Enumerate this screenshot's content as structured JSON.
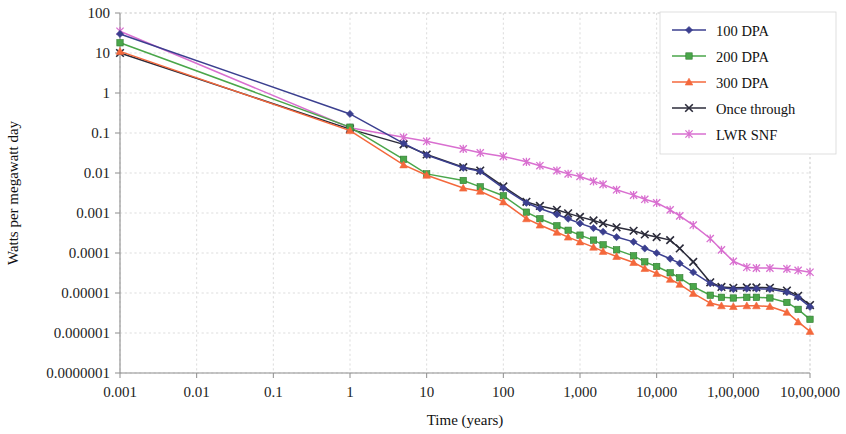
{
  "chart_data": {
    "type": "line",
    "title": "",
    "xlabel": "Time (years)",
    "ylabel": "Watts per megawatt day",
    "xscale": "log",
    "yscale": "log",
    "xlim": [
      0.001,
      1000000
    ],
    "ylim": [
      1e-07,
      100
    ],
    "grid": true,
    "legend_position": "top-right",
    "x_tick_labels": [
      "0.001",
      "0.01",
      "0.1",
      "1",
      "10",
      "100",
      "1,000",
      "10,000",
      "1,00,000",
      "10,00,000"
    ],
    "x_tick_values": [
      0.001,
      0.01,
      0.1,
      1,
      10,
      100,
      1000,
      10000,
      100000,
      1000000
    ],
    "y_tick_labels": [
      "100",
      "10",
      "1",
      "0.1",
      "0.01",
      "0.001",
      "0.0001",
      "0.00001",
      "0.000001",
      "0.0000001"
    ],
    "y_tick_values": [
      100,
      10,
      1,
      0.1,
      0.01,
      0.001,
      0.0001,
      1e-05,
      1e-06,
      1e-07
    ],
    "series": [
      {
        "name": "100 DPA",
        "color": "#3b3f8f",
        "marker": "diamond",
        "points": [
          [
            0.001,
            30
          ],
          [
            1,
            0.3
          ],
          [
            5,
            0.055
          ],
          [
            10,
            0.028
          ],
          [
            30,
            0.0135
          ],
          [
            50,
            0.011
          ],
          [
            100,
            0.0042
          ],
          [
            200,
            0.0018
          ],
          [
            300,
            0.0013
          ],
          [
            500,
            0.00092
          ],
          [
            700,
            0.00072
          ],
          [
            1000,
            0.00055
          ],
          [
            1500,
            0.00042
          ],
          [
            2000,
            0.00034
          ],
          [
            3000,
            0.00025
          ],
          [
            5000,
            0.00019
          ],
          [
            7000,
            0.00013
          ],
          [
            10000,
            0.0001
          ],
          [
            15000,
            7.2e-05
          ],
          [
            20000,
            5.5e-05
          ],
          [
            30000,
            3.3e-05
          ],
          [
            50000,
            1.75e-05
          ],
          [
            70000,
            1.35e-05
          ],
          [
            100000,
            1.25e-05
          ],
          [
            150000,
            1.28e-05
          ],
          [
            200000,
            1.28e-05
          ],
          [
            300000,
            1.25e-05
          ],
          [
            500000,
            1.05e-05
          ],
          [
            700000,
            7.8e-06
          ],
          [
            1000000,
            4.5e-06
          ]
        ]
      },
      {
        "name": "200 DPA",
        "color": "#4aa64a",
        "marker": "square",
        "points": [
          [
            0.001,
            18
          ],
          [
            1,
            0.14
          ],
          [
            5,
            0.022
          ],
          [
            10,
            0.0095
          ],
          [
            30,
            0.0065
          ],
          [
            50,
            0.0045
          ],
          [
            100,
            0.0027
          ],
          [
            200,
            0.00105
          ],
          [
            300,
            0.00072
          ],
          [
            500,
            0.00048
          ],
          [
            700,
            0.00037
          ],
          [
            1000,
            0.00028
          ],
          [
            1500,
            0.00021
          ],
          [
            2000,
            0.00016
          ],
          [
            3000,
            0.00012
          ],
          [
            5000,
            8.5e-05
          ],
          [
            7000,
            6e-05
          ],
          [
            10000,
            4.6e-05
          ],
          [
            15000,
            3.2e-05
          ],
          [
            20000,
            2.4e-05
          ],
          [
            30000,
            1.45e-05
          ],
          [
            50000,
            8.8e-06
          ],
          [
            70000,
            7.8e-06
          ],
          [
            100000,
            7.5e-06
          ],
          [
            150000,
            7.8e-06
          ],
          [
            200000,
            7.8e-06
          ],
          [
            300000,
            7.5e-06
          ],
          [
            500000,
            5.8e-06
          ],
          [
            700000,
            3.9e-06
          ],
          [
            1000000,
            2.2e-06
          ]
        ]
      },
      {
        "name": "300 DPA",
        "color": "#f4683c",
        "marker": "triangle",
        "points": [
          [
            0.001,
            11
          ],
          [
            1,
            0.115
          ],
          [
            5,
            0.016
          ],
          [
            10,
            0.0088
          ],
          [
            30,
            0.0042
          ],
          [
            50,
            0.0035
          ],
          [
            100,
            0.0019
          ],
          [
            200,
            0.00072
          ],
          [
            300,
            0.0005
          ],
          [
            500,
            0.00033
          ],
          [
            700,
            0.00025
          ],
          [
            1000,
            0.00019
          ],
          [
            1500,
            0.00014
          ],
          [
            2000,
            0.00011
          ],
          [
            3000,
            8.2e-05
          ],
          [
            5000,
            5.8e-05
          ],
          [
            7000,
            4.1e-05
          ],
          [
            10000,
            3.1e-05
          ],
          [
            15000,
            2.2e-05
          ],
          [
            20000,
            1.65e-05
          ],
          [
            30000,
            9.8e-06
          ],
          [
            50000,
            5.6e-06
          ],
          [
            70000,
            4.8e-06
          ],
          [
            100000,
            4.6e-06
          ],
          [
            150000,
            4.8e-06
          ],
          [
            200000,
            4.8e-06
          ],
          [
            300000,
            4.6e-06
          ],
          [
            500000,
            3.3e-06
          ],
          [
            700000,
            1.9e-06
          ],
          [
            1000000,
            1.1e-06
          ]
        ]
      },
      {
        "name": "Once through",
        "color": "#2b2b3a",
        "marker": "cross",
        "points": [
          [
            0.001,
            10
          ],
          [
            1,
            0.125
          ],
          [
            5,
            0.052
          ],
          [
            10,
            0.029
          ],
          [
            30,
            0.014
          ],
          [
            50,
            0.0115
          ],
          [
            100,
            0.0046
          ],
          [
            200,
            0.0019
          ],
          [
            300,
            0.0015
          ],
          [
            500,
            0.0012
          ],
          [
            700,
            0.00098
          ],
          [
            1000,
            0.0008
          ],
          [
            1500,
            0.00065
          ],
          [
            2000,
            0.00055
          ],
          [
            3000,
            0.00044
          ],
          [
            5000,
            0.00036
          ],
          [
            7000,
            0.00029
          ],
          [
            10000,
            0.00025
          ],
          [
            15000,
            0.00021
          ],
          [
            20000,
            0.00013
          ],
          [
            30000,
            6e-05
          ],
          [
            50000,
            1.85e-05
          ],
          [
            70000,
            1.42e-05
          ],
          [
            100000,
            1.35e-05
          ],
          [
            150000,
            1.38e-05
          ],
          [
            200000,
            1.38e-05
          ],
          [
            300000,
            1.35e-05
          ],
          [
            500000,
            1.15e-05
          ],
          [
            700000,
            8.5e-06
          ],
          [
            1000000,
            5e-06
          ]
        ]
      },
      {
        "name": "LWR SNF",
        "color": "#d96fd0",
        "marker": "star",
        "points": [
          [
            0.001,
            35
          ],
          [
            1,
            0.135
          ],
          [
            5,
            0.078
          ],
          [
            10,
            0.062
          ],
          [
            30,
            0.04
          ],
          [
            50,
            0.032
          ],
          [
            100,
            0.026
          ],
          [
            200,
            0.019
          ],
          [
            300,
            0.0152
          ],
          [
            500,
            0.0115
          ],
          [
            700,
            0.0095
          ],
          [
            1000,
            0.0082
          ],
          [
            1500,
            0.0062
          ],
          [
            2000,
            0.0052
          ],
          [
            3000,
            0.0038
          ],
          [
            5000,
            0.0028
          ],
          [
            7000,
            0.0022
          ],
          [
            10000,
            0.0018
          ],
          [
            15000,
            0.0012
          ],
          [
            20000,
            0.00085
          ],
          [
            30000,
            0.0005
          ],
          [
            50000,
            0.00023
          ],
          [
            70000,
            0.00012
          ],
          [
            100000,
            6.2e-05
          ],
          [
            150000,
            4.4e-05
          ],
          [
            200000,
            4.2e-05
          ],
          [
            300000,
            4.2e-05
          ],
          [
            500000,
            4e-05
          ],
          [
            700000,
            3.7e-05
          ],
          [
            1000000,
            3.3e-05
          ]
        ]
      }
    ]
  },
  "axes": {
    "x_title": "Time (years)",
    "y_title": "Watts per megawatt day"
  },
  "legend": {
    "items": [
      {
        "label": "100 DPA"
      },
      {
        "label": "200 DPA"
      },
      {
        "label": "300 DPA"
      },
      {
        "label": "Once through"
      },
      {
        "label": "LWR SNF"
      }
    ]
  }
}
